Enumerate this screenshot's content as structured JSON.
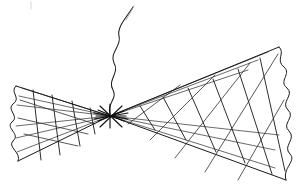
{
  "image": {
    "kind": "hand-drawn-line-illustration",
    "subject": "bowtie-shaped lattice fan with central hub and wavy antenna",
    "width": 301,
    "height": 188,
    "background_color": "#ffffff",
    "ink_color": "#1a1a1a",
    "caption": ""
  },
  "geometry": {
    "hub": {
      "x": 110,
      "y": 116
    },
    "left_wing": {
      "label": "left-lattice-wing",
      "apex": {
        "x": 110,
        "y": 116
      },
      "top_corner": {
        "x": 16,
        "y": 86
      },
      "bottom_corner": {
        "x": 18,
        "y": 161
      },
      "scallop_count": 4
    },
    "right_wing": {
      "label": "right-lattice-wing",
      "apex": {
        "x": 110,
        "y": 116
      },
      "top_corner": {
        "x": 279,
        "y": 47
      },
      "bottom_corner": {
        "x": 286,
        "y": 180
      },
      "scallop_count": 8
    },
    "antenna": {
      "label": "wavy-antenna-tail",
      "base": {
        "x": 110,
        "y": 114
      },
      "tip": {
        "x": 133,
        "y": 7
      },
      "wave_count": 3
    }
  },
  "paths": {
    "left_top_edge": "M110,116 L16,86",
    "left_bottom_edge": "M110,116 L18,161",
    "right_top_edge": "M110,116 L279,47",
    "right_bottom_edge": "M110,116 L286,180",
    "left_scalloped_edge": "M16,86 C9,92 22,98 13,104 C6,110 20,116 12,122 C5,128 21,134 13,141 C7,147 22,153 18,161",
    "right_scalloped_edge": "M279,47 C286,53 275,60 284,67 C292,74 278,81 287,88 C295,95 280,102 288,110 C296,117 281,124 289,131 C297,139 282,146 290,154 C297,161 282,168 286,180",
    "antenna_path": "M110,114 C106,104 118,99 113,90 C107,80 120,73 114,63 C109,53 122,46 119,36 C117,27 126,18 133,7",
    "antenna_fade": "M126,20 L134,6"
  },
  "lattice": {
    "left_wing_ribs_upper": [
      "M110,116 L22,88",
      "M110,116 L19,96",
      "M110,116 L17,105"
    ],
    "left_wing_ribs_lower": [
      "M110,116 L16,126",
      "M110,116 L16,138",
      "M110,116 L17,152"
    ],
    "left_wing_crossbars": [
      "M33,90 L41,160",
      "M52,95 L60,155",
      "M72,101 L80,146",
      "M90,108 L95,134"
    ],
    "right_wing_ribs_upper": [
      "M110,116 L268,52",
      "M110,116 L258,60",
      "M110,116 L248,70"
    ],
    "right_wing_ribs_lower": [
      "M110,116 L279,135",
      "M110,116 L275,150",
      "M110,116 L275,168"
    ],
    "right_wing_crossbars": [
      "M140,106 L155,130",
      "M163,97 L186,140",
      "M188,88 L216,152",
      "M213,79 L245,163",
      "M238,69 L272,174",
      "M260,58 L285,171"
    ],
    "right_wing_counter_diagonals": [
      "M128,124 L180,85",
      "M150,140 L215,75",
      "M175,158 L250,63",
      "M205,172 L278,54",
      "M238,180 L284,100"
    ],
    "left_wing_counter_diagonals": [
      "M20,100 L95,124",
      "M18,118 L88,134",
      "M24,134 L78,146"
    ]
  },
  "hub_rays": [
    "M98,110 L124,121",
    "M98,121 L124,111",
    "M96,116 L126,116",
    "M110,104 L110,128",
    "M100,106 L122,127",
    "M100,127 L122,106",
    "M94,113 L128,119",
    "M94,119 L128,113"
  ],
  "artifacts": {
    "top_left_speck": "M31,2 L31,9"
  }
}
